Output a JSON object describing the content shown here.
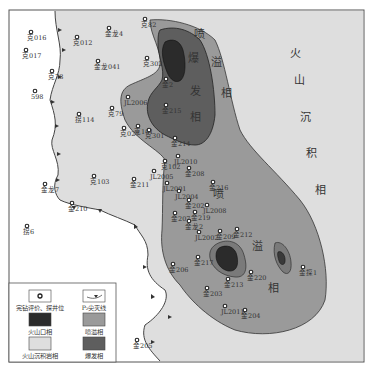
{
  "map": {
    "colors": {
      "crater": "#2b2b2b",
      "explosive": "#5e5e5e",
      "effusive": "#9a9a9a",
      "sedimentary": "#dedede",
      "outside": "#ffffff",
      "frame": "#555555"
    },
    "region_labels": {
      "effusive_top": [
        "喷",
        "溢",
        "相"
      ],
      "explosive": [
        "爆",
        "发",
        "相"
      ],
      "sedimentary": [
        "火",
        "山",
        "沉",
        "积",
        "相"
      ],
      "effusive_mid": [
        "喷",
        "溢",
        "相"
      ]
    },
    "wells": [
      {
        "id": "克016",
        "x": 31,
        "y": 32
      },
      {
        "id": "克017",
        "x": 26,
        "y": 50
      },
      {
        "id": "克78",
        "x": 52,
        "y": 71
      },
      {
        "id": "598",
        "x": 35,
        "y": 91
      },
      {
        "id": "金龙4",
        "x": 109,
        "y": 28
      },
      {
        "id": "克82",
        "x": 145,
        "y": 19
      },
      {
        "id": "克012",
        "x": 77,
        "y": 37
      },
      {
        "id": "金龙041",
        "x": 98,
        "y": 61
      },
      {
        "id": "克302",
        "x": 147,
        "y": 58
      },
      {
        "id": "金2",
        "x": 166,
        "y": 79
      },
      {
        "id": "JL2006",
        "x": 128,
        "y": 97
      },
      {
        "id": "金215",
        "x": 166,
        "y": 105
      },
      {
        "id": "拐114",
        "x": 79,
        "y": 114
      },
      {
        "id": "克79",
        "x": 112,
        "y": 108
      },
      {
        "id": "克101",
        "x": 138,
        "y": 126
      },
      {
        "id": "克027",
        "x": 124,
        "y": 128
      },
      {
        "id": "克301",
        "x": 149,
        "y": 130
      },
      {
        "id": "金214",
        "x": 175,
        "y": 138
      },
      {
        "id": "克103",
        "x": 94,
        "y": 176
      },
      {
        "id": "克102",
        "x": 165,
        "y": 161
      },
      {
        "id": "JL2010",
        "x": 178,
        "y": 156
      },
      {
        "id": "JL2005",
        "x": 154,
        "y": 171
      },
      {
        "id": "金211",
        "x": 134,
        "y": 179
      },
      {
        "id": "JL2001",
        "x": 167,
        "y": 183
      },
      {
        "id": "金208",
        "x": 189,
        "y": 168
      },
      {
        "id": "金216",
        "x": 213,
        "y": 182
      },
      {
        "id": "JL2004",
        "x": 179,
        "y": 191
      },
      {
        "id": "金202",
        "x": 189,
        "y": 200
      },
      {
        "id": "JL2008",
        "x": 207,
        "y": 205
      },
      {
        "id": "金207",
        "x": 175,
        "y": 213
      },
      {
        "id": "金219",
        "x": 195,
        "y": 212
      },
      {
        "id": "金龙2",
        "x": 189,
        "y": 221
      },
      {
        "id": "JL2002",
        "x": 199,
        "y": 232
      },
      {
        "id": "金209",
        "x": 220,
        "y": 231
      },
      {
        "id": "金212",
        "x": 237,
        "y": 229
      },
      {
        "id": "金龙7",
        "x": 45,
        "y": 184
      },
      {
        "id": "金210",
        "x": 72,
        "y": 203
      },
      {
        "id": "拐6",
        "x": 27,
        "y": 226
      },
      {
        "id": "金206",
        "x": 173,
        "y": 264
      },
      {
        "id": "金217",
        "x": 198,
        "y": 257
      },
      {
        "id": "金220",
        "x": 251,
        "y": 272
      },
      {
        "id": "金213",
        "x": 228,
        "y": 279
      },
      {
        "id": "金203",
        "x": 207,
        "y": 288
      },
      {
        "id": "JL2011",
        "x": 225,
        "y": 306
      },
      {
        "id": "金204",
        "x": 245,
        "y": 310
      },
      {
        "id": "金探1",
        "x": 303,
        "y": 267
      },
      {
        "id": "金205",
        "x": 137,
        "y": 340
      }
    ]
  },
  "legend": {
    "items": [
      {
        "label": "完钻评价、探井位",
        "symbol": "well"
      },
      {
        "label": "P₂尖灭线",
        "symbol": "pinchout"
      },
      {
        "label": "火山口相",
        "symbol": "crater"
      },
      {
        "label": "喷溢相",
        "symbol": "effusive"
      },
      {
        "label": "火山沉积岩相",
        "symbol": "sedimentary"
      },
      {
        "label": "爆发相",
        "symbol": "explosive"
      }
    ]
  }
}
